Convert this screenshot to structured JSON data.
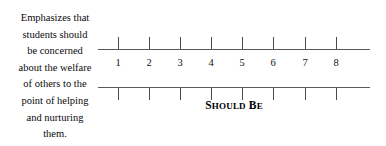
{
  "item": {
    "prompt_lines": [
      "Emphasizes that",
      "students should",
      "be concerned",
      "about the welfare",
      "of others to the",
      "point of helping",
      "and nurturing",
      "them."
    ],
    "caption": "SHOULD BE",
    "caption_parts": {
      "word1_initial": "S",
      "word1_rest": "HOULD",
      "word2_initial": "B",
      "word2_rest": "E"
    }
  },
  "scale": {
    "points": [
      "1",
      "2",
      "3",
      "4",
      "5",
      "6",
      "7",
      "8"
    ],
    "positions_px": [
      20,
      51,
      82,
      113,
      144,
      175,
      207,
      238
    ],
    "min": 1,
    "max": 8,
    "tick_count": 8,
    "rule_color": "#5a5a5a",
    "text_color": "#000000",
    "background": "#ffffff"
  }
}
